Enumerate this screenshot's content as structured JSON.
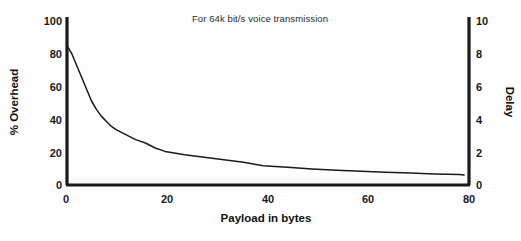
{
  "figure": {
    "background_color": "#fdfdfd",
    "ink_color": "#1a1a1a"
  },
  "chart_data": {
    "type": "line",
    "title": "For 64k bit/s voice transmission",
    "xlabel": "Payload in bytes",
    "ylabel": "% Overhead",
    "y2label": "Delay",
    "xlim": [
      0,
      82
    ],
    "ylim": [
      0,
      100
    ],
    "y2lim": [
      0,
      10
    ],
    "xticks": [
      0,
      20,
      40,
      60,
      80
    ],
    "xtick_labels": [
      "0",
      "20",
      "40",
      "60",
      "80"
    ],
    "yticks": [
      0,
      20,
      40,
      60,
      80,
      100
    ],
    "ytick_labels": [
      "0",
      "20",
      "40",
      "60",
      "80",
      "100"
    ],
    "y2ticks": [
      0,
      2,
      4,
      6,
      8,
      10
    ],
    "y2tick_labels": [
      "0",
      "2",
      "4",
      "6",
      "8",
      "10"
    ],
    "grid": false,
    "legend": false,
    "series": [
      {
        "name": "% Overhead",
        "axis": "left",
        "color": "#1a1a1a",
        "x": [
          0,
          1,
          2,
          3,
          4,
          5,
          6,
          7,
          8,
          9,
          10,
          12,
          14,
          16,
          18,
          20,
          24,
          28,
          32,
          36,
          40,
          45,
          50,
          55,
          60,
          65,
          70,
          75,
          80,
          81
        ],
        "y": [
          83,
          78,
          71,
          64,
          57,
          50,
          45,
          41,
          38,
          35,
          33,
          30,
          27,
          25,
          22,
          20,
          18,
          16.5,
          15,
          13.5,
          11.5,
          10.5,
          9.5,
          8.8,
          8.2,
          7.6,
          7.1,
          6.6,
          6.2,
          6.0
        ]
      }
    ],
    "annotations": []
  },
  "axes": {
    "left_tick_values": [
      "100",
      "80",
      "60",
      "40",
      "20",
      "0"
    ],
    "right_tick_values": [
      "10",
      "8",
      "6",
      "4",
      "2",
      "0"
    ],
    "bottom_tick_values": [
      "0",
      "20",
      "40",
      "60",
      "80"
    ]
  }
}
